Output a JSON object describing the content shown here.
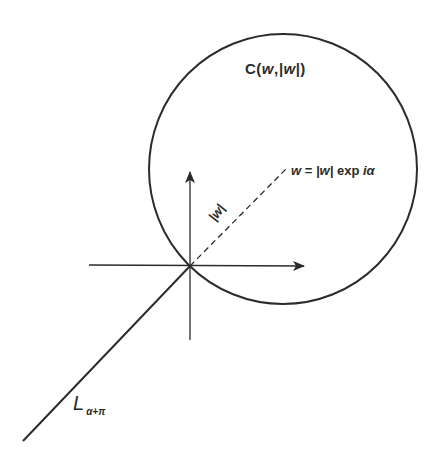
{
  "diagram": {
    "type": "complex-plane-geometry",
    "colors": {
      "ink": "#2b2b2b",
      "background": "#ffffff"
    },
    "labels": {
      "circle": {
        "prefix": "C",
        "open": "(",
        "arg1": "w",
        "sep": ",",
        "arg2": "|w|",
        "close": ")"
      },
      "center_point": {
        "lhs": "w",
        "eq": " = ",
        "modulus": "|w|",
        "func": " exp ",
        "arg": "iα"
      },
      "radius": {
        "text": "|w|"
      },
      "ray": {
        "main": "L",
        "subscript": "α+π"
      }
    },
    "elements": {
      "circle": {
        "cx": 283,
        "cy": 169,
        "rx": 134,
        "ry": 135,
        "stroke_width": 2
      },
      "x_axis": {
        "x1": 89,
        "y1": 265,
        "x2": 304,
        "y2": 266,
        "arrow": "right"
      },
      "y_axis": {
        "x1": 190,
        "y1": 340,
        "x2": 190,
        "y2": 172,
        "arrow": "up"
      },
      "radius_line": {
        "x1": 190,
        "y1": 266,
        "x2": 286,
        "y2": 169,
        "style": "dashed"
      },
      "ray_line": {
        "x1": 190,
        "y1": 266,
        "x2": 23,
        "y2": 441,
        "style": "solid"
      }
    }
  }
}
